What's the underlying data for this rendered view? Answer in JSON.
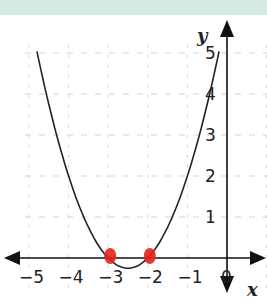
{
  "chart_data": {
    "type": "line",
    "title": "",
    "xlabel": "x",
    "ylabel": "y",
    "xlim": [
      -5.5,
      1
    ],
    "ylim": [
      -0.5,
      5.5
    ],
    "grid": true,
    "x_ticks": [
      "-5",
      "-4",
      "-3",
      "-2",
      "-1",
      "0"
    ],
    "y_ticks": [
      "1",
      "2",
      "3",
      "4",
      "5"
    ],
    "series": [
      {
        "name": "parabola y=(x+2)(x+3)",
        "x": [
          -4.8,
          -4,
          -3.5,
          -3,
          -2.5,
          -2,
          -1.5,
          -1,
          -0.2
        ],
        "values": [
          5.04,
          2,
          0.75,
          0,
          -0.25,
          0,
          0.75,
          2,
          5.04
        ]
      }
    ],
    "annotations": [
      {
        "type": "marker",
        "x": -3,
        "y": 0,
        "color": "#e0241b"
      },
      {
        "type": "marker",
        "x": -2,
        "y": 0,
        "color": "#e0241b"
      }
    ]
  },
  "colors": {
    "band": "#d4ebe6",
    "marker": "#e0241b",
    "axis": "#111111"
  }
}
